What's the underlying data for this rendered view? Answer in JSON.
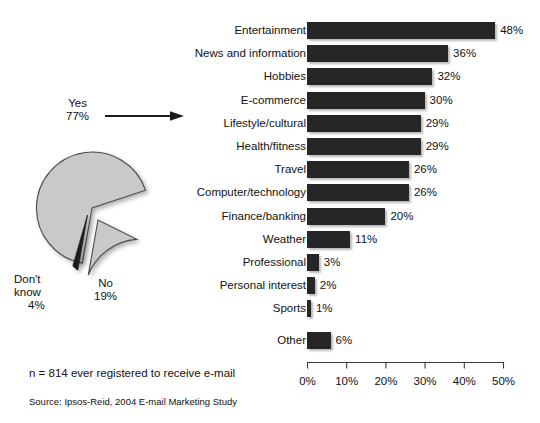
{
  "chart_data": [
    {
      "type": "pie",
      "title": "",
      "name": "Ever registered to receive e-mail",
      "labels": [
        "Yes",
        "No",
        "Don't know"
      ],
      "values": [
        77,
        19,
        4
      ],
      "value_suffix": "%",
      "slice_colors": [
        "#c9c9c9",
        "#c9c9c9",
        "#1e1e1e"
      ],
      "exploded": [
        "No",
        "Don't know"
      ],
      "legend": "none",
      "annotations": [
        "Yes 77%",
        "No 19%",
        "Don't know 4%"
      ]
    },
    {
      "type": "bar",
      "orientation": "horizontal",
      "title": "",
      "xlabel": "",
      "ylabel": "",
      "xlim": [
        0,
        50
      ],
      "xticks": [
        0,
        10,
        20,
        30,
        40,
        50
      ],
      "xticklabels": [
        "0%",
        "10%",
        "20%",
        "30%",
        "40%",
        "50%"
      ],
      "grid": false,
      "legend": "none",
      "bar_color": "#262626",
      "categories": [
        "Entertainment",
        "News and information",
        "Hobbies",
        "E-commerce",
        "Lifestyle/cultural",
        "Health/fitness",
        "Travel",
        "Computer/technology",
        "Finance/banking",
        "Weather",
        "Professional",
        "Personal interest",
        "Sports",
        "Other"
      ],
      "values": [
        48,
        36,
        32,
        30,
        29,
        29,
        26,
        26,
        20,
        11,
        3,
        2,
        1,
        6
      ],
      "value_labels": [
        "48%",
        "36%",
        "32%",
        "30%",
        "29%",
        "29%",
        "26%",
        "26%",
        "20%",
        "11%",
        "3%",
        "2%",
        "1%",
        "6%"
      ]
    }
  ],
  "pie": {
    "yes": {
      "label": "Yes",
      "value": "77%"
    },
    "no": {
      "label": "No",
      "value": "19%"
    },
    "dontknow": {
      "label_line1": "Don't",
      "label_line2": "know",
      "value": "4%"
    }
  },
  "footnotes": {
    "sample": "n = 814 ever registered to receive e-mail",
    "source": "Source: Ipsos-Reid, 2004 E-mail Marketing Study"
  },
  "colors": {
    "bar": "#262626",
    "pie_gray": "#c9c9c9",
    "pie_dark": "#1e1e1e",
    "text": "#111111",
    "axis": "#3a3a3a"
  }
}
